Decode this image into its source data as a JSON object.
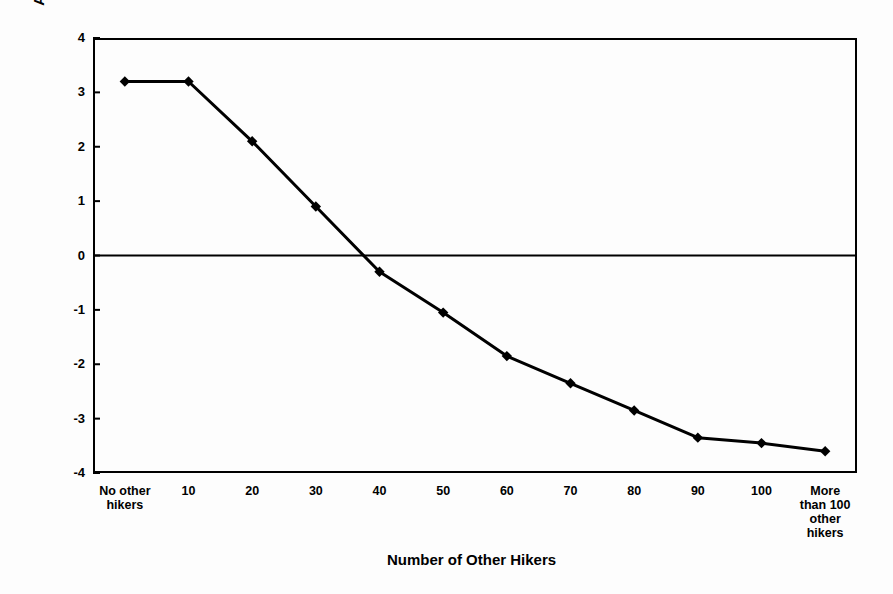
{
  "chart_data": {
    "type": "line",
    "title": "",
    "xlabel": "Number of Other Hikers",
    "ylabel": "Acceptability",
    "categories": [
      "No other\nhikers",
      "10",
      "20",
      "30",
      "40",
      "50",
      "60",
      "70",
      "80",
      "90",
      "100",
      "More\nthan 100\nother\nhikers"
    ],
    "values": [
      3.2,
      3.2,
      2.1,
      0.9,
      -0.3,
      -1.05,
      -1.85,
      -2.35,
      -2.85,
      -3.35,
      -3.45,
      -3.6
    ],
    "ylim": [
      -4,
      4
    ],
    "yticks": [
      "4",
      "3",
      "2",
      "1",
      "0",
      "-1",
      "-2",
      "-3",
      "-4"
    ],
    "ytick_values": [
      4,
      3,
      2,
      1,
      0,
      -1,
      -2,
      -3,
      -4
    ],
    "grid": false,
    "legend": "none",
    "series_color": "#000000",
    "marker": "diamond",
    "zero_line": true,
    "frame_color": "#000000",
    "background_color": "#fdfdfd"
  },
  "axes": {
    "y_title": "Acceptability",
    "x_title": "Number of Other Hikers"
  }
}
